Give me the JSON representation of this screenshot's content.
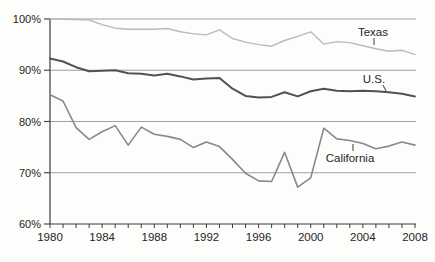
{
  "chart_data": {
    "type": "line",
    "title": "",
    "xlabel": "",
    "ylabel": "",
    "x": [
      1980,
      1981,
      1982,
      1983,
      1984,
      1985,
      1986,
      1987,
      1988,
      1989,
      1990,
      1991,
      1992,
      1993,
      1994,
      1995,
      1996,
      1997,
      1998,
      1999,
      2000,
      2001,
      2002,
      2003,
      2004,
      2005,
      2006,
      2007,
      2008
    ],
    "xlim": [
      1980,
      2008
    ],
    "ylim": [
      60,
      100
    ],
    "yticks": [
      60,
      70,
      80,
      90,
      100
    ],
    "ytick_labels": [
      "60%",
      "70%",
      "80%",
      "90%",
      "100%"
    ],
    "xticks_labeled": [
      1980,
      1984,
      1988,
      1992,
      1996,
      2000,
      2004,
      2008
    ],
    "xtick_labels": [
      "1980",
      "1984",
      "1988",
      "1992",
      "1996",
      "2000",
      "2004",
      "2008"
    ],
    "grid": "horizontal",
    "legend_position": "inline-annotations",
    "axis_color": "#3c3c3c",
    "grid_color": "#9f9f9f",
    "text_color": "#242424",
    "tick_font_px": 11,
    "annotation_font_px": 11.5,
    "series": [
      {
        "name": "Texas",
        "color": "#b7bac1",
        "stroke_width": 1.4,
        "values": [
          100,
          99.95,
          99.9,
          99.8,
          98.9,
          98.2,
          98.0,
          98.0,
          98.0,
          98.15,
          97.5,
          97.1,
          96.9,
          97.9,
          96.2,
          95.5,
          95.0,
          94.7,
          95.8,
          96.6,
          97.5,
          95.1,
          95.6,
          95.4,
          94.8,
          94.2,
          93.7,
          93.9,
          93.1
        ]
      },
      {
        "name": "U.S.",
        "color": "#4f5154",
        "stroke_width": 2,
        "values": [
          92.3,
          91.7,
          90.6,
          89.8,
          89.9,
          90.0,
          89.4,
          89.3,
          89.0,
          89.3,
          88.8,
          88.2,
          88.4,
          88.5,
          86.4,
          85.0,
          84.7,
          84.8,
          85.7,
          84.9,
          85.9,
          86.4,
          86.0,
          85.9,
          86.0,
          85.9,
          85.7,
          85.4,
          84.9
        ]
      },
      {
        "name": "California",
        "color": "#87898c",
        "stroke_width": 1.6,
        "values": [
          85.2,
          84.0,
          78.8,
          76.5,
          78.0,
          79.2,
          75.4,
          78.9,
          77.5,
          77.1,
          76.5,
          74.9,
          76.0,
          75.1,
          72.6,
          69.9,
          68.4,
          68.3,
          74.0,
          67.2,
          69.0,
          78.7,
          76.6,
          76.3,
          75.7,
          74.7,
          75.2,
          76.0,
          75.4
        ]
      }
    ],
    "annotations": [
      {
        "text": "Texas",
        "px": 373,
        "py": 32,
        "leader": [
          374,
          38,
          374,
          45
        ]
      },
      {
        "text": "U.S.",
        "px": 374,
        "py": 79,
        "leader": [
          383,
          85,
          386,
          91
        ]
      },
      {
        "text": "California",
        "px": 350,
        "py": 158,
        "leader": [
          353,
          151,
          353,
          144
        ]
      }
    ]
  }
}
